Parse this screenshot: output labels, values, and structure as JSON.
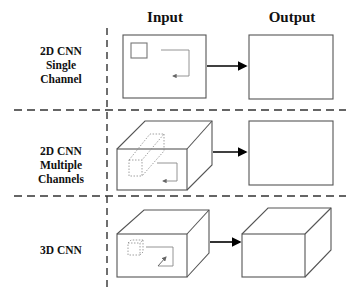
{
  "headers": {
    "input": "Input",
    "output": "Output"
  },
  "rows": [
    {
      "label_lines": [
        "2D CNN",
        "Single",
        "Channel"
      ],
      "input_shape": "2d-rectangle",
      "output_shape": "2d-rectangle"
    },
    {
      "label_lines": [
        "2D CNN",
        "Multiple",
        "Channels"
      ],
      "input_shape": "3d-box",
      "output_shape": "2d-rectangle"
    },
    {
      "label_lines": [
        "3D CNN"
      ],
      "input_shape": "3d-box",
      "output_shape": "3d-box"
    }
  ],
  "colors": {
    "line": "#555555",
    "arrow": "#000000",
    "dashed": "#333333",
    "kernel": "#888888"
  }
}
